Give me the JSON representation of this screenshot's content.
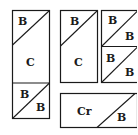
{
  "diagram": {
    "stroke_color": "#1a1a1a",
    "background": "#ffffff",
    "pieces": {
      "left_top": {
        "labels": [
          "B"
        ]
      },
      "left_middle": {
        "labels": [
          "C"
        ]
      },
      "left_bottom": {
        "labels": [
          "B",
          "B"
        ]
      },
      "mid_top": {
        "labels": [
          "B"
        ]
      },
      "mid_middle": {
        "labels": [
          "C"
        ]
      },
      "right_top": {
        "labels": [
          "B",
          "B"
        ]
      },
      "right_bottom": {
        "labels": [
          "B",
          "B"
        ]
      },
      "bottom_wide": {
        "labels": [
          "Cr",
          "B"
        ]
      }
    }
  }
}
